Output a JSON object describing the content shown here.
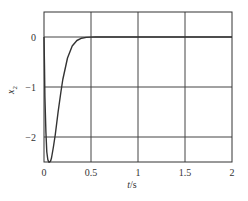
{
  "chart_data": {
    "type": "line",
    "title": "",
    "xlabel": "t/s",
    "ylabel": "x2",
    "xlim": [
      0,
      2
    ],
    "ylim": [
      -2.5,
      0.5
    ],
    "grid": true,
    "legend": null,
    "x_ticks": [
      0,
      0.5,
      1,
      1.5,
      2
    ],
    "x_tick_labels": [
      "0",
      "0.5",
      "1",
      "1.5",
      "2"
    ],
    "y_ticks": [
      0,
      -1,
      -2
    ],
    "y_tick_labels": [
      "0",
      "−1",
      "−2"
    ],
    "series": [
      {
        "name": "x2",
        "color": "#333333",
        "x": [
          0,
          0.005,
          0.01,
          0.02,
          0.03,
          0.04,
          0.05,
          0.06,
          0.07,
          0.08,
          0.1,
          0.12,
          0.15,
          0.18,
          0.2,
          0.25,
          0.3,
          0.35,
          0.4,
          0.45,
          0.5,
          0.55,
          0.6,
          0.8,
          1.0,
          1.5,
          2.0
        ],
        "y": [
          0,
          -0.6,
          -1.2,
          -1.9,
          -2.3,
          -2.45,
          -2.5,
          -2.5,
          -2.48,
          -2.42,
          -2.2,
          -1.95,
          -1.5,
          -1.1,
          -0.85,
          -0.42,
          -0.18,
          -0.07,
          -0.025,
          -0.008,
          -0.002,
          0,
          0,
          0,
          0,
          0,
          0
        ]
      }
    ]
  },
  "labels": {
    "xlabel_t": "t",
    "xlabel_unit": "/s",
    "ylabel_main": "x",
    "ylabel_sub": "2"
  }
}
